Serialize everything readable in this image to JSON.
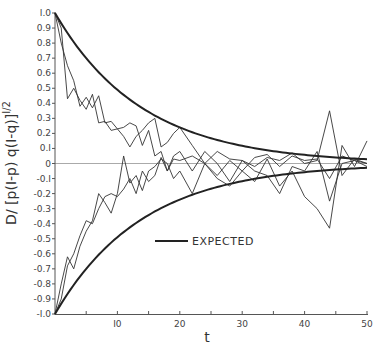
{
  "chart_data": {
    "type": "line",
    "title": "",
    "xlabel": "t",
    "ylabel": "D/ [p(1-p) q(1-q)]^1/2",
    "xlim": [
      0,
      50
    ],
    "ylim": [
      -1.0,
      1.0
    ],
    "grid": false,
    "x_ticks": [
      10,
      20,
      30,
      40,
      50
    ],
    "x_minor_ticks": [
      5,
      15,
      25,
      35,
      45
    ],
    "y_ticks": [
      "1.0",
      "0.9",
      "0.8",
      "0.7",
      "0.6",
      "0.5",
      "0.4",
      "0.3",
      "0.2",
      "0.1",
      "0",
      "-0.1",
      "-0.2",
      "-0.3",
      "-0.4",
      "-0.5",
      "-0.6",
      "-0.7",
      "-0.8",
      "-0.9",
      "-1.0"
    ],
    "legend": {
      "position": "lower center",
      "entries": [
        "EXPECTED"
      ]
    },
    "expected": {
      "name": "EXPECTED",
      "formula": "±exp(-t/14)",
      "upper_start": 1.0,
      "lower_start": -1.0
    },
    "series": [
      {
        "name": "sim-upper-1",
        "x": [
          0,
          1,
          2,
          3,
          4,
          5,
          6,
          7,
          8,
          9,
          10,
          11,
          12,
          13,
          14,
          15,
          16,
          17,
          18,
          19,
          20,
          22,
          24,
          26,
          28,
          30,
          32,
          34,
          36,
          38,
          40,
          42,
          44,
          46,
          48,
          50
        ],
        "values": [
          1.0,
          0.8,
          0.65,
          0.55,
          0.38,
          0.44,
          0.37,
          0.45,
          0.27,
          0.28,
          0.23,
          0.24,
          0.27,
          0.25,
          0.12,
          0.22,
          0.05,
          0.08,
          -0.05,
          0.03,
          0.02,
          0.05,
          0.0,
          -0.08,
          0.02,
          -0.05,
          0.04,
          0.06,
          -0.02,
          0.05,
          0.02,
          0.03,
          -0.1,
          0.05,
          0.02,
          0.0
        ]
      },
      {
        "name": "sim-upper-2",
        "x": [
          0,
          1,
          2,
          3,
          4,
          5,
          6,
          7,
          8,
          9,
          10,
          11,
          12,
          13,
          14,
          15,
          16,
          17,
          18,
          19,
          20,
          22,
          24,
          26,
          28,
          30,
          32,
          34,
          36,
          38,
          40,
          42,
          44,
          46,
          48,
          50
        ],
        "values": [
          1.0,
          0.9,
          0.43,
          0.5,
          0.42,
          0.36,
          0.46,
          0.27,
          0.28,
          0.22,
          0.23,
          0.18,
          0.11,
          0.18,
          0.22,
          0.27,
          0.3,
          0.11,
          0.14,
          0.2,
          0.24,
          0.12,
          0.0,
          0.08,
          0.03,
          0.02,
          -0.02,
          0.04,
          0.02,
          0.07,
          0.0,
          0.02,
          0.35,
          -0.08,
          0.03,
          0.0
        ]
      },
      {
        "name": "sim-lower-1",
        "x": [
          0,
          1,
          2,
          3,
          4,
          5,
          6,
          7,
          8,
          9,
          10,
          11,
          12,
          13,
          14,
          15,
          16,
          17,
          18,
          19,
          20,
          22,
          24,
          26,
          28,
          30,
          32,
          34,
          36,
          38,
          40,
          42,
          44,
          46,
          48,
          50
        ],
        "values": [
          -1.0,
          -0.8,
          -0.62,
          -0.7,
          -0.55,
          -0.45,
          -0.38,
          -0.2,
          -0.26,
          -0.33,
          -0.2,
          0.05,
          -0.13,
          -0.08,
          -0.18,
          -0.05,
          -0.02,
          0.03,
          0.0,
          -0.1,
          -0.05,
          -0.2,
          0.0,
          -0.1,
          -0.15,
          -0.05,
          -0.12,
          0.03,
          -0.15,
          -0.05,
          -0.22,
          -0.3,
          -0.43,
          0.12,
          -0.02,
          0.15
        ]
      },
      {
        "name": "sim-lower-2",
        "x": [
          0,
          1,
          2,
          3,
          4,
          5,
          6,
          7,
          8,
          9,
          10,
          11,
          12,
          13,
          14,
          15,
          16,
          17,
          18,
          19,
          20,
          22,
          24,
          26,
          28,
          30,
          32,
          34,
          36,
          38,
          40,
          42,
          44,
          46,
          48,
          50
        ],
        "values": [
          -1.0,
          -0.9,
          -0.68,
          -0.6,
          -0.48,
          -0.38,
          -0.4,
          -0.3,
          -0.22,
          -0.2,
          -0.22,
          -0.17,
          -0.1,
          -0.2,
          -0.05,
          -0.12,
          -0.08,
          0.04,
          -0.05,
          0.05,
          0.08,
          -0.05,
          0.08,
          0.0,
          -0.12,
          0.02,
          -0.05,
          -0.08,
          -0.2,
          -0.02,
          -0.05,
          0.08,
          -0.25,
          0.0,
          0.02,
          -0.02
        ]
      }
    ]
  }
}
